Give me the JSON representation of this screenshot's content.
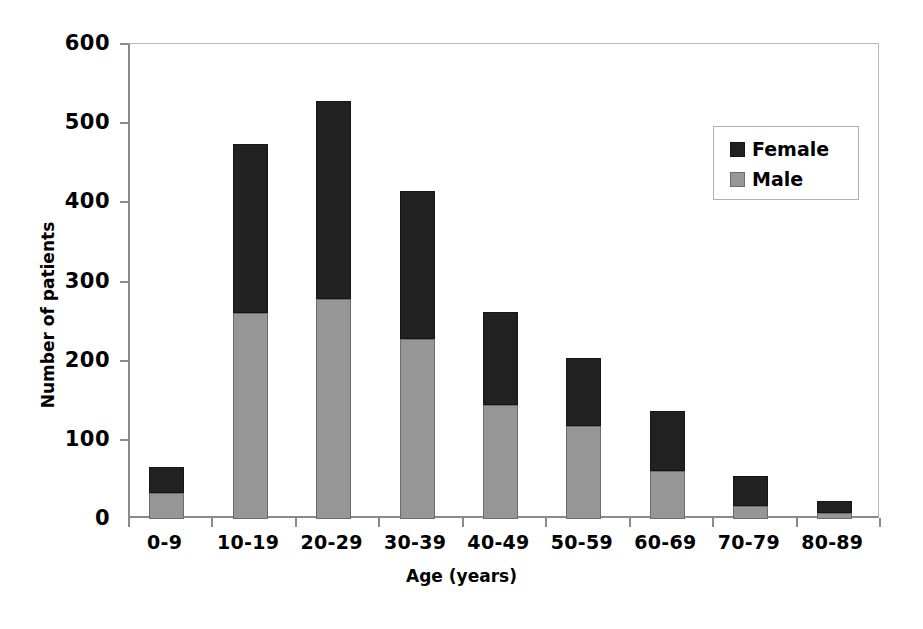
{
  "chart_data": {
    "type": "bar",
    "subtype": "stacked-vertical",
    "title": "",
    "xlabel": "Age (years)",
    "ylabel": "Number of patients",
    "categories": [
      "0-9",
      "10-19",
      "20-29",
      "30-39",
      "40-49",
      "50-59",
      "60-69",
      "70-79",
      "80-89"
    ],
    "series": [
      {
        "name": "Male",
        "color": "#969696",
        "values": [
          33,
          260,
          278,
          227,
          144,
          117,
          61,
          16,
          8
        ]
      },
      {
        "name": "Female",
        "color": "#212121",
        "values": [
          33,
          214,
          250,
          187,
          117,
          86,
          75,
          38,
          15
        ]
      }
    ],
    "totals": [
      66,
      474,
      528,
      414,
      261,
      203,
      136,
      54,
      23
    ],
    "stack_order": [
      "Male",
      "Female"
    ],
    "ylim": [
      0,
      600
    ],
    "yticks": [
      0,
      100,
      200,
      300,
      400,
      500,
      600
    ],
    "ytick_labels": [
      "0",
      "100",
      "200",
      "300",
      "400",
      "500",
      "600"
    ],
    "grid": false,
    "legend_position": "upper-right",
    "legend_entries": [
      "Female",
      "Male"
    ]
  },
  "axes": {
    "y_title": "Number of patients",
    "x_title": "Age (years)"
  },
  "legend": {
    "items": [
      {
        "label": "Female",
        "color": "#212121"
      },
      {
        "label": "Male",
        "color": "#969696"
      }
    ]
  }
}
